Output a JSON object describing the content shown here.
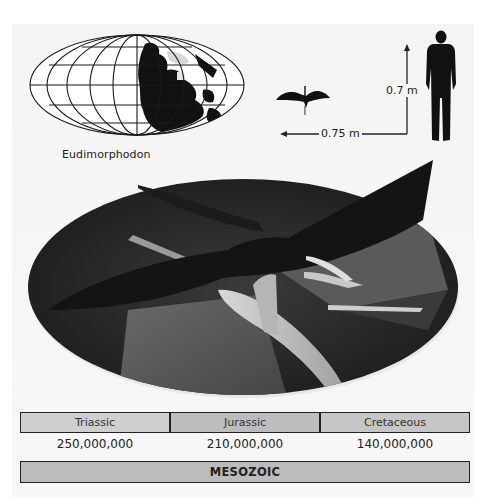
{
  "species": {
    "name": "Eudimorphodon"
  },
  "scale": {
    "height_label": "0.7 m",
    "wingspan_label": "0.75 m"
  },
  "timeline": {
    "periods": [
      {
        "label": "Triassic",
        "start_year": "250,000,000"
      },
      {
        "label": "Jurassic",
        "start_year": "210,000,000"
      },
      {
        "label": "Cretaceous",
        "start_year": "140,000,000"
      }
    ],
    "era": "MESOZOIC"
  },
  "colors": {
    "panel_bg": "#f5f5f5",
    "period_fill": "#c4c4c4",
    "era_fill": "#bcbcbc",
    "outline": "#222222",
    "silhouette": "#111111"
  }
}
